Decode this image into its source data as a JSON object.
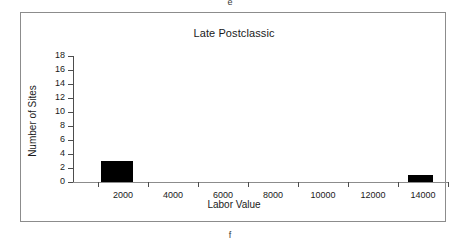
{
  "figure": {
    "panel_letter_top": "e",
    "panel_letter_bottom": "f",
    "frame_color": "#8c8c8c"
  },
  "chart_data": {
    "type": "bar",
    "title": "Late Postclassic",
    "xlabel": "Labor Value",
    "ylabel": "Number of Sites",
    "xlim": [
      0,
      15000
    ],
    "ylim": [
      0,
      18
    ],
    "grid": false,
    "legend": "none",
    "bar_color": "#000000",
    "xticks": [
      2000,
      4000,
      6000,
      8000,
      10000,
      12000,
      14000
    ],
    "xtick_labels": [
      "2000",
      "4000",
      "6000",
      "8000",
      "10000",
      "12000",
      "14000"
    ],
    "yticks": [
      0,
      2,
      4,
      6,
      8,
      10,
      12,
      14,
      16,
      18
    ],
    "ytick_labels": [
      "0",
      "2",
      "4",
      "6",
      "8",
      "10",
      "12",
      "14",
      "16",
      "18"
    ],
    "bars": [
      {
        "label": "2000",
        "x_start": 1100,
        "x_end": 2400,
        "value": 3
      },
      {
        "label": "14000",
        "x_start": 13400,
        "x_end": 14400,
        "value": 1
      }
    ]
  }
}
